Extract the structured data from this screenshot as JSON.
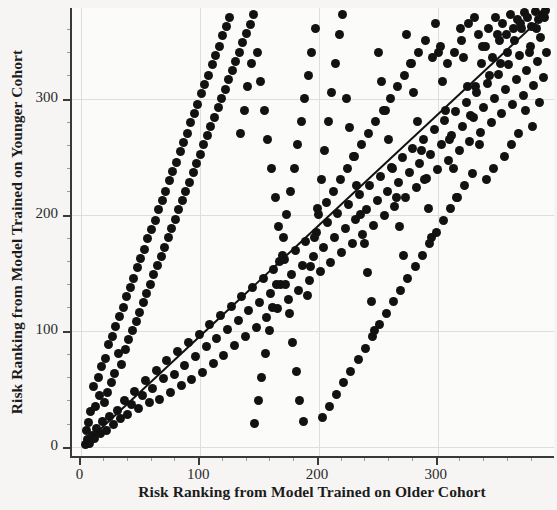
{
  "chart_data": {
    "type": "scatter",
    "title": "",
    "xlabel": "Risk Ranking from Model Trained on Older Cohort",
    "ylabel": "Risk Ranking from Model Trained on Younger Cohort",
    "xlim": [
      -8,
      398
    ],
    "ylim": [
      -8,
      378
    ],
    "xticks": [
      0,
      100,
      200,
      300
    ],
    "yticks": [
      0,
      100,
      200,
      300
    ],
    "xticklabels": [
      "0",
      "100",
      "200",
      "300"
    ],
    "yticklabels": [
      "0",
      "100",
      "200",
      "300"
    ],
    "grid": true,
    "legend": null,
    "marker": {
      "shape": "circle",
      "color": "#121212",
      "size_px": 9
    },
    "fit_line": {
      "type": "identity-diagonal",
      "color": "#111111",
      "width_px": 2,
      "x_start": 2,
      "y_start": 2,
      "x_end": 392,
      "y_end": 374
    },
    "n_points": 420,
    "points": [
      [
        3,
        2
      ],
      [
        5,
        6
      ],
      [
        7,
        3
      ],
      [
        9,
        10
      ],
      [
        4,
        14
      ],
      [
        11,
        7
      ],
      [
        13,
        16
      ],
      [
        6,
        21
      ],
      [
        16,
        11
      ],
      [
        8,
        30
      ],
      [
        18,
        22
      ],
      [
        12,
        35
      ],
      [
        21,
        14
      ],
      [
        15,
        44
      ],
      [
        24,
        26
      ],
      [
        10,
        52
      ],
      [
        27,
        19
      ],
      [
        19,
        38
      ],
      [
        30,
        31
      ],
      [
        14,
        60
      ],
      [
        33,
        24
      ],
      [
        22,
        47
      ],
      [
        36,
        40
      ],
      [
        17,
        69
      ],
      [
        39,
        28
      ],
      [
        25,
        55
      ],
      [
        42,
        36
      ],
      [
        20,
        76
      ],
      [
        45,
        48
      ],
      [
        28,
        63
      ],
      [
        31,
        80
      ],
      [
        48,
        33
      ],
      [
        23,
        88
      ],
      [
        51,
        44
      ],
      [
        34,
        71
      ],
      [
        54,
        57
      ],
      [
        26,
        95
      ],
      [
        57,
        38
      ],
      [
        37,
        84
      ],
      [
        60,
        50
      ],
      [
        29,
        104
      ],
      [
        63,
        66
      ],
      [
        40,
        92
      ],
      [
        66,
        41
      ],
      [
        32,
        112
      ],
      [
        69,
        59
      ],
      [
        43,
        100
      ],
      [
        72,
        74
      ],
      [
        35,
        120
      ],
      [
        75,
        47
      ],
      [
        46,
        108
      ],
      [
        78,
        62
      ],
      [
        38,
        129
      ],
      [
        81,
        82
      ],
      [
        49,
        116
      ],
      [
        84,
        53
      ],
      [
        41,
        137
      ],
      [
        87,
        70
      ],
      [
        52,
        124
      ],
      [
        90,
        90
      ],
      [
        44,
        145
      ],
      [
        93,
        58
      ],
      [
        55,
        132
      ],
      [
        96,
        78
      ],
      [
        47,
        154
      ],
      [
        99,
        97
      ],
      [
        58,
        140
      ],
      [
        102,
        64
      ],
      [
        50,
        162
      ],
      [
        105,
        86
      ],
      [
        61,
        148
      ],
      [
        108,
        105
      ],
      [
        53,
        170
      ],
      [
        111,
        72
      ],
      [
        64,
        156
      ],
      [
        114,
        93
      ],
      [
        56,
        179
      ],
      [
        117,
        113
      ],
      [
        67,
        164
      ],
      [
        120,
        79
      ],
      [
        59,
        187
      ],
      [
        123,
        101
      ],
      [
        70,
        172
      ],
      [
        126,
        121
      ],
      [
        62,
        195
      ],
      [
        129,
        87
      ],
      [
        73,
        180
      ],
      [
        132,
        109
      ],
      [
        65,
        204
      ],
      [
        135,
        129
      ],
      [
        76,
        188
      ],
      [
        138,
        95
      ],
      [
        68,
        212
      ],
      [
        141,
        117
      ],
      [
        79,
        196
      ],
      [
        144,
        137
      ],
      [
        71,
        220
      ],
      [
        147,
        103
      ],
      [
        82,
        204
      ],
      [
        150,
        124
      ],
      [
        74,
        229
      ],
      [
        153,
        145
      ],
      [
        85,
        212
      ],
      [
        156,
        111
      ],
      [
        77,
        237
      ],
      [
        159,
        132
      ],
      [
        88,
        220
      ],
      [
        162,
        153
      ],
      [
        80,
        245
      ],
      [
        165,
        119
      ],
      [
        91,
        228
      ],
      [
        168,
        140
      ],
      [
        83,
        254
      ],
      [
        171,
        161
      ],
      [
        94,
        236
      ],
      [
        174,
        127
      ],
      [
        86,
        262
      ],
      [
        177,
        148
      ],
      [
        97,
        244
      ],
      [
        180,
        169
      ],
      [
        89,
        270
      ],
      [
        183,
        135
      ],
      [
        100,
        252
      ],
      [
        186,
        156
      ],
      [
        92,
        279
      ],
      [
        189,
        177
      ],
      [
        103,
        260
      ],
      [
        192,
        143
      ],
      [
        95,
        287
      ],
      [
        195,
        164
      ],
      [
        106,
        268
      ],
      [
        198,
        185
      ],
      [
        98,
        295
      ],
      [
        201,
        151
      ],
      [
        109,
        276
      ],
      [
        204,
        172
      ],
      [
        101,
        304
      ],
      [
        207,
        193
      ],
      [
        112,
        284
      ],
      [
        210,
        159
      ],
      [
        104,
        312
      ],
      [
        213,
        180
      ],
      [
        115,
        292
      ],
      [
        216,
        201
      ],
      [
        107,
        320
      ],
      [
        219,
        167
      ],
      [
        118,
        300
      ],
      [
        222,
        188
      ],
      [
        110,
        329
      ],
      [
        225,
        209
      ],
      [
        121,
        308
      ],
      [
        228,
        175
      ],
      [
        113,
        337
      ],
      [
        231,
        196
      ],
      [
        124,
        316
      ],
      [
        234,
        217
      ],
      [
        116,
        345
      ],
      [
        237,
        183
      ],
      [
        127,
        324
      ],
      [
        240,
        204
      ],
      [
        119,
        354
      ],
      [
        243,
        225
      ],
      [
        130,
        332
      ],
      [
        246,
        191
      ],
      [
        122,
        362
      ],
      [
        249,
        212
      ],
      [
        133,
        340
      ],
      [
        252,
        233
      ],
      [
        125,
        370
      ],
      [
        255,
        199
      ],
      [
        136,
        348
      ],
      [
        258,
        220
      ],
      [
        139,
        356
      ],
      [
        261,
        241
      ],
      [
        142,
        364
      ],
      [
        264,
        207
      ],
      [
        145,
        372
      ],
      [
        267,
        228
      ],
      [
        148,
        340
      ],
      [
        270,
        249
      ],
      [
        151,
        315
      ],
      [
        273,
        215
      ],
      [
        154,
        290
      ],
      [
        276,
        236
      ],
      [
        157,
        265
      ],
      [
        279,
        257
      ],
      [
        160,
        240
      ],
      [
        282,
        223
      ],
      [
        163,
        215
      ],
      [
        285,
        244
      ],
      [
        166,
        190
      ],
      [
        288,
        265
      ],
      [
        169,
        165
      ],
      [
        291,
        231
      ],
      [
        172,
        140
      ],
      [
        294,
        252
      ],
      [
        175,
        115
      ],
      [
        297,
        273
      ],
      [
        178,
        90
      ],
      [
        300,
        239
      ],
      [
        181,
        65
      ],
      [
        303,
        260
      ],
      [
        184,
        40
      ],
      [
        306,
        281
      ],
      [
        187,
        22
      ],
      [
        309,
        247
      ],
      [
        190,
        130
      ],
      [
        312,
        268
      ],
      [
        193,
        155
      ],
      [
        315,
        289
      ],
      [
        196,
        180
      ],
      [
        318,
        255
      ],
      [
        199,
        205
      ],
      [
        321,
        276
      ],
      [
        202,
        230
      ],
      [
        324,
        297
      ],
      [
        205,
        255
      ],
      [
        327,
        263
      ],
      [
        208,
        280
      ],
      [
        330,
        284
      ],
      [
        211,
        305
      ],
      [
        333,
        305
      ],
      [
        214,
        330
      ],
      [
        336,
        271
      ],
      [
        217,
        355
      ],
      [
        339,
        292
      ],
      [
        220,
        372
      ],
      [
        342,
        313
      ],
      [
        223,
        300
      ],
      [
        345,
        279
      ],
      [
        226,
        275
      ],
      [
        348,
        300
      ],
      [
        229,
        250
      ],
      [
        351,
        321
      ],
      [
        232,
        225
      ],
      [
        354,
        287
      ],
      [
        235,
        200
      ],
      [
        357,
        308
      ],
      [
        238,
        175
      ],
      [
        360,
        329
      ],
      [
        241,
        150
      ],
      [
        363,
        295
      ],
      [
        244,
        125
      ],
      [
        366,
        316
      ],
      [
        247,
        100
      ],
      [
        369,
        337
      ],
      [
        250,
        340
      ],
      [
        372,
        303
      ],
      [
        253,
        315
      ],
      [
        375,
        324
      ],
      [
        256,
        290
      ],
      [
        378,
        345
      ],
      [
        259,
        265
      ],
      [
        381,
        311
      ],
      [
        262,
        240
      ],
      [
        384,
        332
      ],
      [
        265,
        215
      ],
      [
        387,
        353
      ],
      [
        268,
        190
      ],
      [
        390,
        370
      ],
      [
        271,
        165
      ],
      [
        392,
        340
      ],
      [
        274,
        355
      ],
      [
        389,
        318
      ],
      [
        277,
        330
      ],
      [
        386,
        297
      ],
      [
        280,
        305
      ],
      [
        383,
        360
      ],
      [
        283,
        280
      ],
      [
        380,
        276
      ],
      [
        286,
        255
      ],
      [
        377,
        340
      ],
      [
        289,
        230
      ],
      [
        374,
        290
      ],
      [
        292,
        205
      ],
      [
        371,
        360
      ],
      [
        295,
        180
      ],
      [
        368,
        270
      ],
      [
        298,
        365
      ],
      [
        365,
        350
      ],
      [
        301,
        340
      ],
      [
        362,
        260
      ],
      [
        304,
        315
      ],
      [
        359,
        340
      ],
      [
        307,
        290
      ],
      [
        356,
        250
      ],
      [
        310,
        265
      ],
      [
        353,
        330
      ],
      [
        313,
        240
      ],
      [
        350,
        355
      ],
      [
        316,
        215
      ],
      [
        347,
        240
      ],
      [
        319,
        360
      ],
      [
        344,
        320
      ],
      [
        322,
        335
      ],
      [
        341,
        230
      ],
      [
        325,
        310
      ],
      [
        338,
        345
      ],
      [
        328,
        285
      ],
      [
        335,
        260
      ],
      [
        331,
        370
      ],
      [
        332,
        310
      ],
      [
        334,
        355
      ],
      [
        329,
        235
      ],
      [
        337,
        330
      ],
      [
        326,
        365
      ],
      [
        340,
        345
      ],
      [
        323,
        225
      ],
      [
        343,
        360
      ],
      [
        320,
        350
      ],
      [
        346,
        335
      ],
      [
        317,
        215
      ],
      [
        349,
        370
      ],
      [
        314,
        340
      ],
      [
        352,
        350
      ],
      [
        311,
        205
      ],
      [
        355,
        365
      ],
      [
        308,
        330
      ],
      [
        358,
        355
      ],
      [
        305,
        195
      ],
      [
        361,
        372
      ],
      [
        302,
        345
      ],
      [
        364,
        360
      ],
      [
        299,
        185
      ],
      [
        367,
        368
      ],
      [
        296,
        335
      ],
      [
        370,
        365
      ],
      [
        293,
        175
      ],
      [
        373,
        374
      ],
      [
        290,
        350
      ],
      [
        376,
        370
      ],
      [
        287,
        165
      ],
      [
        379,
        362
      ],
      [
        284,
        340
      ],
      [
        382,
        375
      ],
      [
        281,
        155
      ],
      [
        385,
        368
      ],
      [
        278,
        330
      ],
      [
        388,
        372
      ],
      [
        275,
        145
      ],
      [
        391,
        376
      ],
      [
        272,
        320
      ],
      [
        269,
        135
      ],
      [
        266,
        310
      ],
      [
        263,
        125
      ],
      [
        260,
        300
      ],
      [
        257,
        115
      ],
      [
        254,
        290
      ],
      [
        251,
        105
      ],
      [
        248,
        280
      ],
      [
        245,
        95
      ],
      [
        242,
        270
      ],
      [
        239,
        85
      ],
      [
        236,
        260
      ],
      [
        233,
        75
      ],
      [
        230,
        250
      ],
      [
        227,
        65
      ],
      [
        224,
        240
      ],
      [
        221,
        55
      ],
      [
        218,
        230
      ],
      [
        215,
        45
      ],
      [
        212,
        220
      ],
      [
        209,
        35
      ],
      [
        206,
        210
      ],
      [
        203,
        25
      ],
      [
        200,
        200
      ],
      [
        197,
        360
      ],
      [
        194,
        340
      ],
      [
        191,
        320
      ],
      [
        188,
        300
      ],
      [
        185,
        280
      ],
      [
        182,
        260
      ],
      [
        179,
        240
      ],
      [
        176,
        220
      ],
      [
        173,
        200
      ],
      [
        170,
        180
      ],
      [
        167,
        160
      ],
      [
        164,
        140
      ],
      [
        161,
        120
      ],
      [
        158,
        100
      ],
      [
        155,
        80
      ],
      [
        152,
        60
      ],
      [
        149,
        40
      ],
      [
        146,
        20
      ],
      [
        143,
        330
      ],
      [
        140,
        310
      ],
      [
        137,
        290
      ],
      [
        134,
        270
      ]
    ]
  }
}
